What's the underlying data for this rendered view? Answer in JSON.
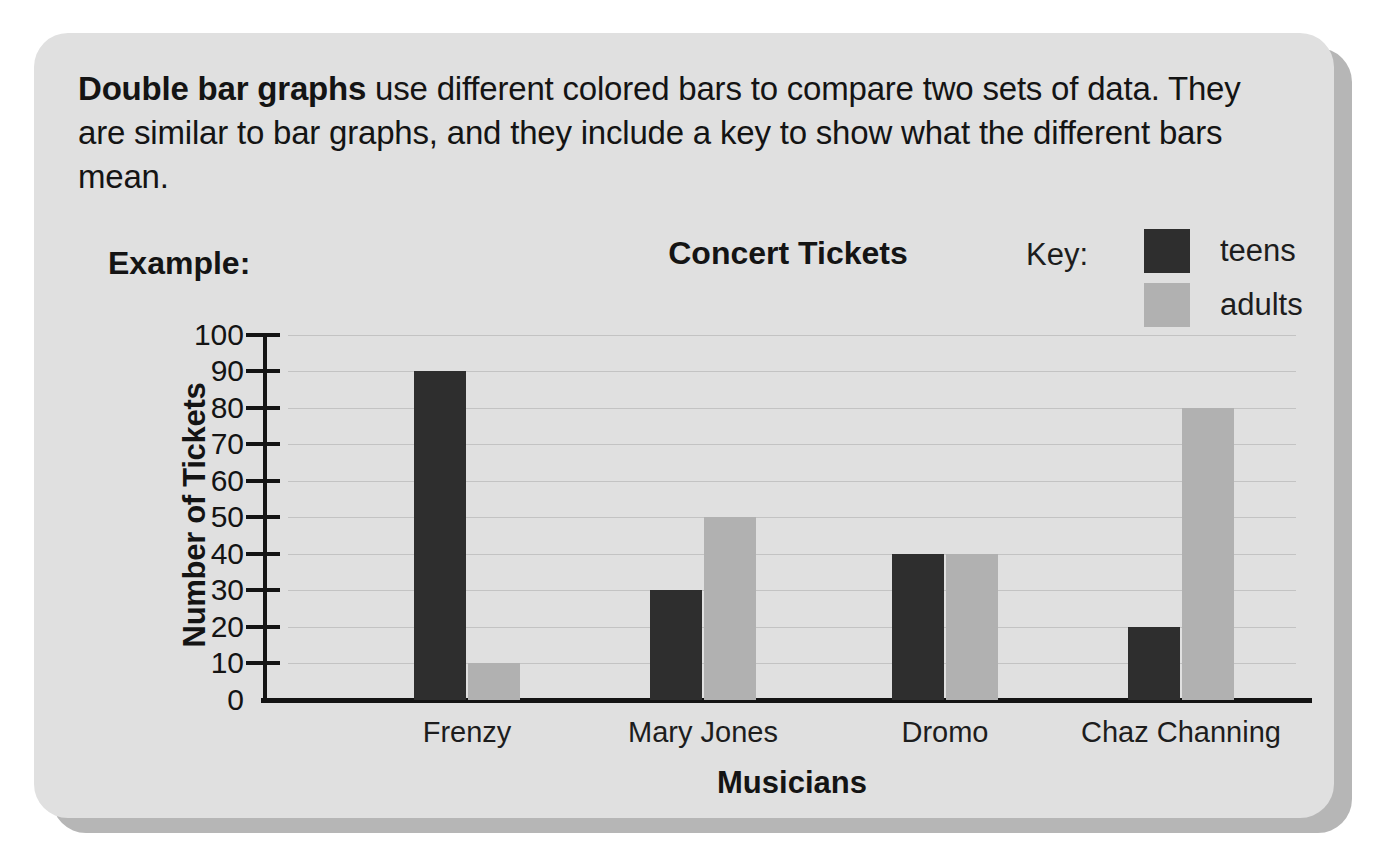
{
  "lesson": {
    "intro_bold": "Double bar graphs",
    "intro_rest": " use different colored bars to compare two sets of data. They are similar to bar graphs, and they include a key to show what the different bars mean.",
    "example_label": "Example:"
  },
  "legend": {
    "title": "Key:",
    "entries": [
      {
        "label": "teens",
        "color": "#2e2e2e"
      },
      {
        "label": "adults",
        "color": "#b1b1b1"
      }
    ]
  },
  "colors": {
    "teens": "#2e2e2e",
    "adults": "#b1b1b1",
    "card": "#e0e0e0",
    "card_shadow": "#b6b6b6",
    "axis": "#141414",
    "gridline": "#c3c3c3"
  },
  "chart_data": {
    "type": "bar",
    "title": "Concert Tickets",
    "xlabel": "Musicians",
    "ylabel": "Number of Tickets",
    "categories": [
      "Frenzy",
      "Mary Jones",
      "Dromo",
      "Chaz Channing"
    ],
    "series": [
      {
        "name": "teens",
        "color": "#2e2e2e",
        "values": [
          90,
          30,
          40,
          20
        ]
      },
      {
        "name": "adults",
        "color": "#b1b1b1",
        "values": [
          10,
          50,
          40,
          80
        ]
      }
    ],
    "ylim": [
      0,
      100
    ],
    "ytick_labels": [
      "100",
      "90",
      "80",
      "70",
      "60",
      "50",
      "40",
      "30",
      "20",
      "10",
      "0"
    ],
    "ytick_values": [
      100,
      90,
      80,
      70,
      60,
      50,
      40,
      30,
      20,
      10,
      0
    ],
    "ytick_step": 10,
    "grid": true,
    "legend_position": "top-right"
  }
}
